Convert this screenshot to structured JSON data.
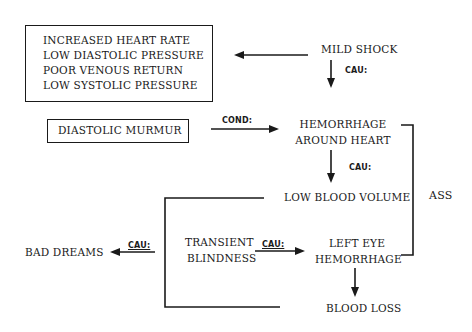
{
  "diagram": {
    "nodes": {
      "symptoms_box": {
        "lines": [
          "INCREASED HEART RATE",
          "LOW DIASTOLIC PRESSURE",
          "POOR VENOUS RETURN",
          "LOW SYSTOLIC PRESSURE"
        ]
      },
      "mild_shock": "MILD SHOCK",
      "diastolic_murmur": "DIASTOLIC MURMUR",
      "hemorrhage_around_heart": {
        "line1": "HEMORRHAGE",
        "line2": "AROUND HEART"
      },
      "low_blood_volume": "LOW BLOOD VOLUME",
      "transient_blindness": {
        "line1": "TRANSIENT",
        "line2": "BLINDNESS"
      },
      "left_eye_hemorrhage": {
        "line1": "LEFT EYE",
        "line2": "HEMORRHAGE"
      },
      "blood_loss": "BLOOD LOSS",
      "bad_dreams": "BAD DREAMS"
    },
    "relations": {
      "mild_shock_to_symptoms": "",
      "mild_shock_to_hemorrhage": "CAU:",
      "murmur_to_hemorrhage": "COND:",
      "hemorrhage_to_low_volume": "CAU:",
      "blindness_to_left_eye": "CAU:",
      "bracket_to_bad_dreams": "CAU:",
      "left_eye_to_blood_loss": ""
    },
    "association_bracket_label": "ASS"
  }
}
